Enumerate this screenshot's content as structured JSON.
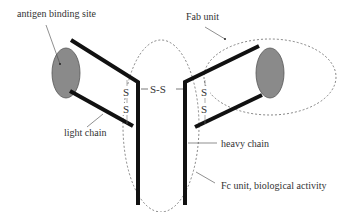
{
  "diagram": {
    "type": "antibody structure",
    "labels": {
      "antigen_binding_site": "antigen binding site",
      "fab_unit": "Fab unit",
      "light_chain": "light chain",
      "heavy_chain": "heavy chain",
      "fc_unit": "Fc unit, biological activity"
    },
    "bonds": {
      "hinge": "S-S",
      "left_s1": "S",
      "left_s2": "S",
      "right_s1": "S",
      "right_s2": "S"
    },
    "colors": {
      "chain": "#111111",
      "binding_site": "#8a8a8a",
      "outline": "#555555",
      "text": "#333333"
    }
  }
}
